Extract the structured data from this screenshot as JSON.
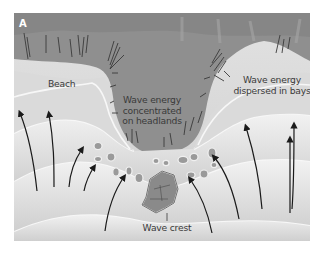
{
  "figure": {
    "panel_letter": "A",
    "labels": {
      "beach": "Beach",
      "headland_line1": "Wave energy",
      "headland_line2": "concentrated",
      "headland_line3": "on headlands",
      "bay_line1": "Wave energy",
      "bay_line2": "dispersed in bays",
      "wave_crest": "Wave crest"
    },
    "colors": {
      "land": "#8f8f8f",
      "land_dark": "#7c7c7c",
      "beach": "#d4d4d4",
      "water_light": "#e6e6e6",
      "water_mid": "#cfcfcf",
      "crest_line": "#f7f7f7",
      "arrow": "#1a1a1a",
      "rock": "#9a9a9a"
    }
  }
}
